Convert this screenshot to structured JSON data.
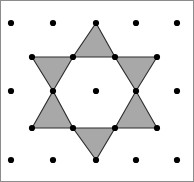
{
  "figure": {
    "width": 194,
    "height": 182,
    "background_color": "#ffffff",
    "border_color": "#8c8c8c"
  },
  "style": {
    "triangle_fill": "#a8a8a8",
    "triangle_stroke": "#2b2b2b",
    "triangle_stroke_width": 1.1,
    "dot_color": "#000000",
    "dot_radius": 3.1
  },
  "chart_data": {
    "type": "scatter",
    "xlabel": "",
    "ylabel": "",
    "xlim": [
      0,
      194
    ],
    "ylim": [
      0,
      182
    ],
    "grid": false,
    "legend": "none",
    "lattice_rows": [
      {
        "y": 23,
        "x": [
          11,
          53,
          96,
          136,
          177
        ]
      },
      {
        "y": 57,
        "x": [
          32,
          73,
          115,
          157
        ]
      },
      {
        "y": 91,
        "x": [
          11,
          53,
          96,
          136,
          177
        ]
      },
      {
        "y": 128,
        "x": [
          32,
          73,
          115,
          157
        ]
      },
      {
        "y": 160,
        "x": [
          11,
          53,
          96,
          136,
          177
        ]
      }
    ],
    "dots": [
      [
        11,
        23
      ],
      [
        53,
        23
      ],
      [
        96,
        23
      ],
      [
        136,
        23
      ],
      [
        177,
        23
      ],
      [
        32,
        57
      ],
      [
        73,
        57
      ],
      [
        115,
        57
      ],
      [
        157,
        57
      ],
      [
        11,
        91
      ],
      [
        53,
        91
      ],
      [
        96,
        91
      ],
      [
        136,
        91
      ],
      [
        177,
        91
      ],
      [
        32,
        128
      ],
      [
        73,
        128
      ],
      [
        115,
        128
      ],
      [
        157,
        128
      ],
      [
        11,
        160
      ],
      [
        53,
        160
      ],
      [
        96,
        160
      ],
      [
        136,
        160
      ],
      [
        177,
        160
      ]
    ],
    "hexagram_points": {
      "outer_tips": [
        [
          96,
          23
        ],
        [
          157,
          57
        ],
        [
          157,
          128
        ],
        [
          96,
          160
        ],
        [
          32,
          128
        ],
        [
          32,
          57
        ]
      ],
      "inner_hexagon": [
        [
          73,
          57
        ],
        [
          115,
          57
        ],
        [
          136,
          91
        ],
        [
          115,
          128
        ],
        [
          73,
          128
        ],
        [
          53,
          91
        ]
      ]
    },
    "triangles": [
      {
        "name": "triangle-top",
        "points": "96,23 115,57 73,57"
      },
      {
        "name": "triangle-upper-right",
        "points": "157,57 136,91 115,57"
      },
      {
        "name": "triangle-lower-right",
        "points": "157,128 115,128 136,91"
      },
      {
        "name": "triangle-bottom",
        "points": "96,160 73,128 115,128"
      },
      {
        "name": "triangle-lower-left",
        "points": "32,128 53,91 73,128"
      },
      {
        "name": "triangle-upper-left",
        "points": "32,57 73,57 53,91"
      }
    ],
    "counts": {
      "lattice_dots": 23,
      "triangles": 6,
      "hexagram_tips": 6
    }
  }
}
